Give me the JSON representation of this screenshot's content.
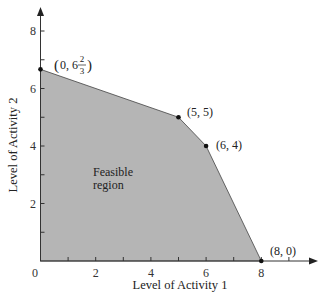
{
  "chart_data": {
    "type": "area",
    "title": "",
    "xlabel": "Level of Activity 1",
    "ylabel": "Level of Activity 2",
    "xlim": [
      0,
      9.5
    ],
    "ylim": [
      0,
      9
    ],
    "x_ticks": [
      0,
      2,
      4,
      6,
      8
    ],
    "y_ticks": [
      2,
      4,
      6,
      8
    ],
    "x_tick_labels": [
      "0",
      "2",
      "4",
      "6",
      "8"
    ],
    "y_tick_labels": [
      "2",
      "4",
      "6",
      "8"
    ],
    "minor_ticks_every": 1,
    "grid": false,
    "legend": null,
    "feasible_region": {
      "label_line1": "Feasible",
      "label_line2": "region",
      "fill": "#b5b5b5",
      "vertices": [
        [
          0,
          0
        ],
        [
          0,
          6.6667
        ],
        [
          5,
          5
        ],
        [
          6,
          4
        ],
        [
          8,
          0
        ]
      ]
    },
    "corner_points": [
      {
        "x": 0,
        "y": 6.6667,
        "label": "(0, 6 2/3)",
        "label_main": "(0, 6",
        "frac_num": "2",
        "frac_den": "3",
        "label_close": ")"
      },
      {
        "x": 5,
        "y": 5,
        "label": "(5, 5)"
      },
      {
        "x": 6,
        "y": 4,
        "label": "(6, 4)"
      },
      {
        "x": 8,
        "y": 0,
        "label": "(8, 0)"
      }
    ]
  }
}
